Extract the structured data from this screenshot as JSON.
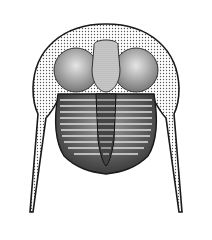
{
  "image": {
    "subject": "trilobite",
    "style": "stippled pen-and-ink illustration",
    "background": "#ffffff",
    "ink": "#1a1a1a"
  }
}
